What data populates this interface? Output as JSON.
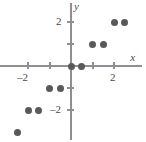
{
  "chart_data": {
    "type": "scatter",
    "title": "",
    "xlabel": "x",
    "ylabel": "y",
    "grid": false,
    "legend": null,
    "xlim": [
      -3.3,
      3.5
    ],
    "ylim": [
      -3.6,
      3.0
    ],
    "x_ticks": [
      -2,
      2
    ],
    "y_ticks": [
      -2,
      2
    ],
    "x_tick_labels": [
      "–2",
      "2"
    ],
    "y_tick_labels": [
      "–2",
      "2"
    ],
    "x_minor_ticks": [
      -1,
      1
    ],
    "y_minor_ticks": [
      -1,
      1
    ],
    "point_color": "#595959",
    "axis_color": "#8e8e93",
    "points": [
      {
        "x": -2.5,
        "y": -3.0
      },
      {
        "x": -2.0,
        "y": -2.0
      },
      {
        "x": -1.5,
        "y": -2.0
      },
      {
        "x": -1.0,
        "y": -1.0
      },
      {
        "x": -0.5,
        "y": -1.0
      },
      {
        "x": 0.0,
        "y": 0.0
      },
      {
        "x": 0.5,
        "y": 0.0
      },
      {
        "x": 1.0,
        "y": 1.0
      },
      {
        "x": 1.5,
        "y": 1.0
      },
      {
        "x": 2.0,
        "y": 2.0
      },
      {
        "x": 2.5,
        "y": 2.0
      }
    ]
  }
}
